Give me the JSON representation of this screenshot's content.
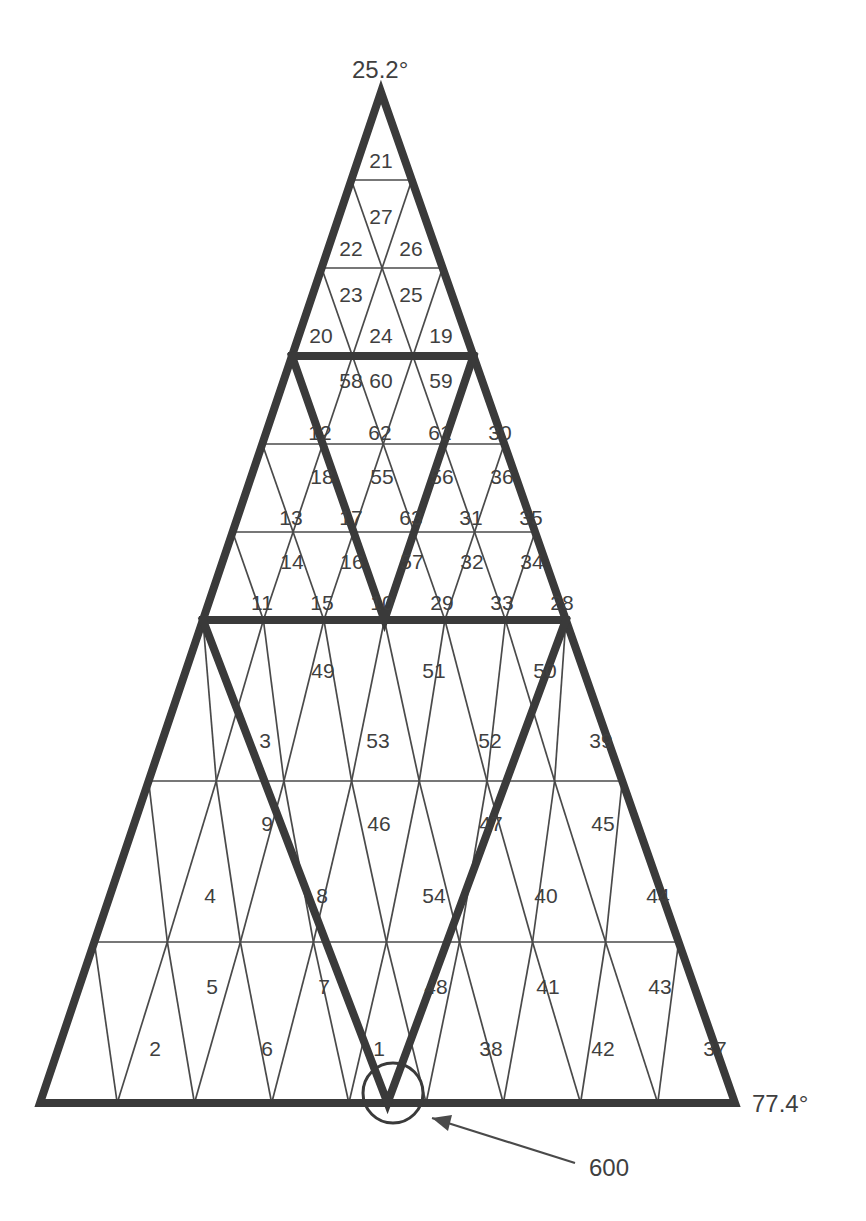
{
  "diagram": {
    "title_fragment": "",
    "apex_angle_label": "25.2°",
    "base_angle_label": "77.4°",
    "callout_label": "600",
    "callout_target": "circle-at-v-apex-on-baseline",
    "stroke_colors": {
      "thin": "#4a4a4a",
      "thick": "#3a3a3a",
      "text": "#3f3f3f",
      "background": "#ffffff"
    },
    "geometry": {
      "apex": [
        381,
        92
      ],
      "base_left": [
        40,
        1103
      ],
      "base_right": [
        735,
        1103
      ],
      "row_lines_y": [
        92,
        180,
        268,
        356,
        444,
        532,
        620,
        781,
        942,
        1103
      ],
      "thick_row_lines_y": [
        356,
        620,
        1103
      ]
    },
    "sections": [
      {
        "name": "upper",
        "rows": [
          {
            "y_top": 92,
            "y_bot": 180,
            "up": [
              "21"
            ],
            "down": []
          },
          {
            "y_top": 180,
            "y_bot": 268,
            "up": [
              "22",
              "26"
            ],
            "down": [
              "27"
            ]
          },
          {
            "y_top": 268,
            "y_bot": 356,
            "up": [
              "20",
              "24",
              "19"
            ],
            "down": [
              "23",
              "25"
            ]
          }
        ]
      },
      {
        "name": "middle",
        "rows": [
          {
            "y_top": 356,
            "y_bot": 444,
            "up": [
              "58",
              "60",
              "59"
            ],
            "down": []
          },
          {
            "y_top": 444,
            "y_bot": 532,
            "up": [
              "12",
              "62",
              "61",
              "30"
            ],
            "down": [
              "18",
              "55",
              "56",
              "36"
            ]
          },
          {
            "y_top": 532,
            "y_bot": 620,
            "up": [
              "13",
              "17",
              "63",
              "31",
              "35"
            ],
            "down": [
              "14",
              "16",
              "57",
              "32",
              "34"
            ]
          },
          {
            "y_top": 620,
            "y_bot": 620,
            "up": [
              "11",
              "15",
              "10",
              "29",
              "33",
              "28"
            ],
            "down": []
          }
        ]
      },
      {
        "name": "lower",
        "rows": [
          {
            "y_top": 620,
            "y_bot": 781,
            "up": [
              "49",
              "51",
              "50"
            ],
            "down": []
          },
          {
            "y_top": 781,
            "y_bot": 942,
            "up": [
              "3",
              "53",
              "52",
              "39"
            ],
            "down": [
              "9",
              "46",
              "47",
              "45"
            ]
          },
          {
            "y_top": 942,
            "y_bot": 1103,
            "up": [
              "4",
              "8",
              "54",
              "40",
              "44"
            ],
            "down": [
              "5",
              "7",
              "48",
              "41",
              "43"
            ]
          },
          {
            "y_top": 1103,
            "y_bot": 1103,
            "up": [
              "2",
              "6",
              "1",
              "38",
              "42",
              "37"
            ],
            "down": []
          }
        ]
      }
    ],
    "cells": [
      {
        "id": "21",
        "x": 381,
        "y": 162
      },
      {
        "id": "27",
        "x": 381,
        "y": 218
      },
      {
        "id": "22",
        "x": 351,
        "y": 250
      },
      {
        "id": "26",
        "x": 411,
        "y": 250
      },
      {
        "id": "23",
        "x": 351,
        "y": 296
      },
      {
        "id": "25",
        "x": 411,
        "y": 296
      },
      {
        "id": "20",
        "x": 321,
        "y": 337
      },
      {
        "id": "24",
        "x": 381,
        "y": 337
      },
      {
        "id": "19",
        "x": 441,
        "y": 337
      },
      {
        "id": "58",
        "x": 351,
        "y": 382
      },
      {
        "id": "60",
        "x": 381,
        "y": 382
      },
      {
        "id": "59",
        "x": 441,
        "y": 382
      },
      {
        "id": "12",
        "x": 320,
        "y": 434
      },
      {
        "id": "62",
        "x": 380,
        "y": 434
      },
      {
        "id": "61",
        "x": 440,
        "y": 434
      },
      {
        "id": "30",
        "x": 500,
        "y": 434
      },
      {
        "id": "18",
        "x": 322,
        "y": 478
      },
      {
        "id": "55",
        "x": 382,
        "y": 478
      },
      {
        "id": "56",
        "x": 442,
        "y": 478
      },
      {
        "id": "36",
        "x": 502,
        "y": 478
      },
      {
        "id": "13",
        "x": 291,
        "y": 519
      },
      {
        "id": "17",
        "x": 351,
        "y": 519
      },
      {
        "id": "63",
        "x": 411,
        "y": 519
      },
      {
        "id": "31",
        "x": 471,
        "y": 519
      },
      {
        "id": "35",
        "x": 531,
        "y": 519
      },
      {
        "id": "14",
        "x": 292,
        "y": 563
      },
      {
        "id": "16",
        "x": 352,
        "y": 563
      },
      {
        "id": "57",
        "x": 412,
        "y": 563
      },
      {
        "id": "32",
        "x": 472,
        "y": 563
      },
      {
        "id": "34",
        "x": 532,
        "y": 563
      },
      {
        "id": "11",
        "x": 262,
        "y": 604
      },
      {
        "id": "15",
        "x": 322,
        "y": 604
      },
      {
        "id": "10",
        "x": 382,
        "y": 604
      },
      {
        "id": "29",
        "x": 442,
        "y": 604
      },
      {
        "id": "33",
        "x": 502,
        "y": 604
      },
      {
        "id": "28",
        "x": 562,
        "y": 604
      },
      {
        "id": "49",
        "x": 323,
        "y": 672
      },
      {
        "id": "51",
        "x": 434,
        "y": 672
      },
      {
        "id": "50",
        "x": 545,
        "y": 672
      },
      {
        "id": "3",
        "x": 265,
        "y": 742
      },
      {
        "id": "53",
        "x": 378,
        "y": 742
      },
      {
        "id": "52",
        "x": 490,
        "y": 742
      },
      {
        "id": "39",
        "x": 601,
        "y": 742
      },
      {
        "id": "9",
        "x": 267,
        "y": 825
      },
      {
        "id": "46",
        "x": 379,
        "y": 825
      },
      {
        "id": "47",
        "x": 491,
        "y": 825
      },
      {
        "id": "45",
        "x": 603,
        "y": 825
      },
      {
        "id": "4",
        "x": 210,
        "y": 897
      },
      {
        "id": "8",
        "x": 322,
        "y": 897
      },
      {
        "id": "54",
        "x": 434,
        "y": 897
      },
      {
        "id": "40",
        "x": 546,
        "y": 897
      },
      {
        "id": "44",
        "x": 658,
        "y": 897
      },
      {
        "id": "5",
        "x": 212,
        "y": 988
      },
      {
        "id": "7",
        "x": 324,
        "y": 988
      },
      {
        "id": "48",
        "x": 436,
        "y": 988
      },
      {
        "id": "41",
        "x": 548,
        "y": 988
      },
      {
        "id": "43",
        "x": 660,
        "y": 988
      },
      {
        "id": "2",
        "x": 155,
        "y": 1050
      },
      {
        "id": "6",
        "x": 267,
        "y": 1050
      },
      {
        "id": "1",
        "x": 379,
        "y": 1050
      },
      {
        "id": "38",
        "x": 491,
        "y": 1050
      },
      {
        "id": "42",
        "x": 603,
        "y": 1050
      },
      {
        "id": "37",
        "x": 715,
        "y": 1050
      }
    ]
  }
}
